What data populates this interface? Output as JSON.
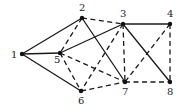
{
  "diagram": {
    "type": "graph",
    "nodes": [
      {
        "id": "1",
        "label": "1",
        "x": 22,
        "y": 54,
        "lx": 11,
        "ly": 58
      },
      {
        "id": "2",
        "label": "2",
        "x": 82,
        "y": 18,
        "lx": 79,
        "ly": 11
      },
      {
        "id": "3",
        "label": "3",
        "x": 123,
        "y": 24,
        "lx": 120,
        "ly": 17
      },
      {
        "id": "4",
        "label": "4",
        "x": 170,
        "y": 24,
        "lx": 167,
        "ly": 17
      },
      {
        "id": "5",
        "label": "5",
        "x": 60,
        "y": 53,
        "lx": 54,
        "ly": 63
      },
      {
        "id": "6",
        "label": "6",
        "x": 81,
        "y": 91,
        "lx": 78,
        "ly": 104
      },
      {
        "id": "7",
        "label": "7",
        "x": 125,
        "y": 82,
        "lx": 122,
        "ly": 95
      },
      {
        "id": "8",
        "label": "8",
        "x": 170,
        "y": 82,
        "lx": 167,
        "ly": 95
      }
    ],
    "edges": [
      {
        "from": "1",
        "to": "2",
        "style": "solid"
      },
      {
        "from": "1",
        "to": "5",
        "style": "solid"
      },
      {
        "from": "1",
        "to": "6",
        "style": "solid"
      },
      {
        "from": "2",
        "to": "7",
        "style": "solid"
      },
      {
        "from": "5",
        "to": "3",
        "style": "solid"
      },
      {
        "from": "3",
        "to": "4",
        "style": "solid"
      },
      {
        "from": "3",
        "to": "8",
        "style": "solid"
      },
      {
        "from": "2",
        "to": "5",
        "style": "dashed"
      },
      {
        "from": "2",
        "to": "3",
        "style": "dashed"
      },
      {
        "from": "3",
        "to": "6",
        "style": "dashed"
      },
      {
        "from": "3",
        "to": "7",
        "style": "dashed"
      },
      {
        "from": "5",
        "to": "6",
        "style": "dashed"
      },
      {
        "from": "5",
        "to": "7",
        "style": "dashed"
      },
      {
        "from": "4",
        "to": "7",
        "style": "dashed"
      },
      {
        "from": "4",
        "to": "8",
        "style": "dashed"
      },
      {
        "from": "6",
        "to": "7",
        "style": "dashed"
      },
      {
        "from": "7",
        "to": "8",
        "style": "dashed"
      }
    ]
  }
}
